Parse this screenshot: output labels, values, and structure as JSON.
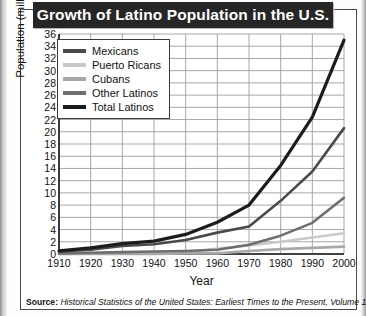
{
  "title": "Growth of Latino Population in the U.S.",
  "source": {
    "label": "Source:",
    "text": "Historical Statistics of the United States: Earliest Times to the Present, Volume 1."
  },
  "colors": {
    "mexicans": "#4a4a4a",
    "puerto_ricans": "#c9c9c9",
    "cubans": "#a8a8a8",
    "other_latinos": "#6e6e6e",
    "total_latinos": "#1c1c1c",
    "grid": "#9d9d9d",
    "axis": "#1d1d1d",
    "title_bar": "#262626"
  },
  "chart_data": {
    "type": "line",
    "title": "Growth of Latino Population in the U.S.",
    "xlabel": "Year",
    "ylabel": "Population (millions)",
    "xlim": [
      1910,
      2000
    ],
    "ylim": [
      0,
      36
    ],
    "ytick_step": 2,
    "grid": true,
    "legend_position": "top-left",
    "x": [
      1910,
      1920,
      1930,
      1940,
      1950,
      1960,
      1970,
      1980,
      1990,
      2000
    ],
    "xticks": [
      "1910",
      "1920",
      "1930",
      "1940",
      "1950",
      "1960",
      "1970",
      "1980",
      "1990",
      "2000"
    ],
    "yticks": [
      "0",
      "2",
      "4",
      "6",
      "8",
      "10",
      "12",
      "14",
      "16",
      "18",
      "20",
      "22",
      "24",
      "26",
      "28",
      "30",
      "32",
      "34",
      "36"
    ],
    "series": [
      {
        "name": "Mexicans",
        "key": "mexicans",
        "color": "#4a4a4a",
        "values": [
          0.4,
          0.7,
          1.3,
          1.6,
          2.3,
          3.5,
          4.5,
          8.7,
          13.5,
          20.6
        ]
      },
      {
        "name": "Puerto Ricans",
        "key": "puerto_ricans",
        "color": "#c9c9c9",
        "values": [
          0.0,
          0.1,
          0.1,
          0.1,
          0.3,
          0.9,
          1.4,
          2.0,
          2.7,
          3.4
        ]
      },
      {
        "name": "Cubans",
        "key": "cubans",
        "color": "#a8a8a8",
        "values": [
          0.0,
          0.0,
          0.0,
          0.0,
          0.1,
          0.1,
          0.5,
          0.8,
          1.0,
          1.2
        ]
      },
      {
        "name": "Other Latinos",
        "key": "other_latinos",
        "color": "#6e6e6e",
        "values": [
          0.1,
          0.2,
          0.3,
          0.4,
          0.5,
          0.7,
          1.5,
          3.0,
          5.1,
          9.2
        ]
      },
      {
        "name": "Total Latinos",
        "key": "total_latinos",
        "color": "#1c1c1c",
        "values": [
          0.5,
          1.0,
          1.7,
          2.1,
          3.2,
          5.2,
          8.0,
          14.5,
          22.4,
          35.0
        ]
      }
    ]
  }
}
